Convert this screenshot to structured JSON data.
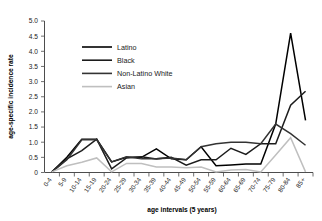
{
  "figure": {
    "partial_title_above": "",
    "background_color": "#ffffff"
  },
  "axes": {
    "y_axis_title": "age-specific incidence rate",
    "x_axis_title": "age intervals (5 years)",
    "y_tick_labels": [
      "5.0",
      "4.5",
      "4.0",
      "3.5",
      "3.0",
      "2.5",
      "2.0",
      "1.5",
      "1.0",
      "0.5",
      "0"
    ],
    "x_tick_labels": [
      "0-4",
      "5-9",
      "10-14",
      "15-19",
      "20-24",
      "25-29",
      "30-34",
      "35-39",
      "40-44",
      "45-49",
      "50-54",
      "55-59",
      "60-64",
      "65-69",
      "70-74",
      "75-79",
      "80-84",
      "85+"
    ]
  },
  "legend": {
    "position": "upper-left-inside",
    "entries": [
      {
        "label": "Latino",
        "color": "#000000"
      },
      {
        "label": "Black",
        "color": "#1c1c1c"
      },
      {
        "label": "Non-Latino White",
        "color": "#333333"
      },
      {
        "label": "Asian",
        "color": "#bfbfbf"
      }
    ]
  },
  "chart_data": {
    "type": "line",
    "title": "",
    "subtitle": "",
    "xlabel": "age intervals (5 years)",
    "ylabel": "age-specific incidence rate",
    "ylim": [
      0,
      5.0
    ],
    "ytick_step": 0.5,
    "grid": false,
    "legend_position": "upper-left-inside",
    "categories": [
      "0-4",
      "5-9",
      "10-14",
      "15-19",
      "20-24",
      "25-29",
      "30-34",
      "35-39",
      "40-44",
      "45-49",
      "50-54",
      "55-59",
      "60-64",
      "65-69",
      "70-74",
      "75-79",
      "80-84",
      "85+"
    ],
    "series": [
      {
        "name": "Latino",
        "color": "#000000",
        "width": 1.5,
        "values": [
          0.02,
          0.5,
          1.1,
          1.1,
          0.35,
          0.5,
          0.5,
          0.78,
          0.45,
          0.42,
          0.85,
          0.22,
          0.25,
          0.28,
          0.28,
          1.6,
          4.6,
          1.72
        ]
      },
      {
        "name": "Black",
        "color": "#1c1c1c",
        "width": 1.5,
        "values": [
          0.02,
          0.45,
          0.72,
          1.1,
          0.12,
          0.48,
          0.52,
          0.45,
          0.5,
          0.24,
          0.42,
          0.42,
          0.8,
          0.6,
          0.95,
          0.95,
          2.22,
          2.68
        ]
      },
      {
        "name": "Non-Latino White",
        "color": "#333333",
        "width": 1.5,
        "values": [
          0.02,
          0.42,
          1.08,
          1.08,
          0.35,
          0.52,
          0.45,
          0.45,
          0.48,
          0.42,
          0.85,
          0.95,
          1.0,
          1.0,
          0.95,
          1.6,
          1.28,
          0.9
        ]
      },
      {
        "name": "Asian",
        "color": "#bfbfbf",
        "width": 1.5,
        "values": [
          0.02,
          0.22,
          0.34,
          0.48,
          0.02,
          0.3,
          0.3,
          0.18,
          0.18,
          0.16,
          0.18,
          0.02,
          0.08,
          0.1,
          0.02,
          0.58,
          1.15,
          0.02
        ]
      }
    ]
  }
}
